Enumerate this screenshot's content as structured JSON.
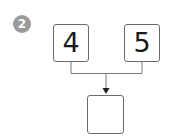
{
  "step_badge": {
    "label": "2",
    "color": "#9a9a9a"
  },
  "diagram": {
    "type": "number-bond-addition",
    "inputs": [
      {
        "label": "4"
      },
      {
        "label": "5"
      }
    ],
    "result": {
      "label": ""
    },
    "line_color": "#7a7a7a",
    "box_border_color": "#6b6b6b"
  }
}
